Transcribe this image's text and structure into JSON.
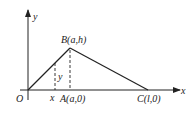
{
  "diagram": {
    "type": "coordinate-geometry",
    "axes": {
      "x_label": "x",
      "y_label": "y",
      "origin_label": "O"
    },
    "points": {
      "B": {
        "label": "B(a,h)"
      },
      "A": {
        "label": "A(a,0)"
      },
      "C": {
        "label": "C(l,0)"
      }
    },
    "markers": {
      "x_tick_label": "x",
      "y_segment_label": "y"
    },
    "colors": {
      "stroke": "#222222",
      "background": "#ffffff"
    }
  }
}
